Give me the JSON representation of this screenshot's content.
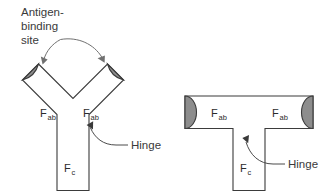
{
  "figure": {
    "title_text": "Antibody structure diagram",
    "background_color": "#ffffff",
    "outline_color": "#3b3b3b",
    "cap_fill_color": "#8d8d8d",
    "text_color": "#2b2b2b",
    "leader_color": "#707070"
  },
  "callouts": {
    "antigen_binding_site": {
      "line1": "Antigen-",
      "line2": "binding",
      "line3": "site"
    },
    "hinge_left": "Hinge",
    "hinge_right": "Hinge"
  },
  "left_figure": {
    "name": "Y-shaped antibody",
    "labels": {
      "fab_left_main": "F",
      "fab_left_sub": "ab",
      "fab_right_main": "F",
      "fab_right_sub": "ab",
      "fc_main": "F",
      "fc_sub": "c"
    }
  },
  "right_figure": {
    "name": "T-shaped antibody",
    "labels": {
      "fab_left_main": "F",
      "fab_left_sub": "ab",
      "fab_right_main": "F",
      "fab_right_sub": "ab",
      "fc_main": "F",
      "fc_sub": "c"
    }
  }
}
